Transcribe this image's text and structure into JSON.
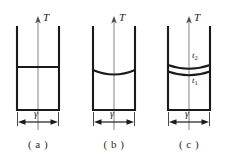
{
  "figure": {
    "width": 227,
    "height": 162,
    "background": "#ffffff",
    "stroke_color": "#1a1a1a",
    "axis_color": "#8a8a8a"
  },
  "labels": {
    "axis_T": "T",
    "gamma": "γ",
    "t_upper": "t",
    "t_upper_sub": "2",
    "t_lower": "t",
    "t_lower_sub": "1"
  },
  "panels": [
    {
      "id": "panel-a",
      "caption": "( a )",
      "axis_label": "T",
      "width_label": "γ",
      "surface_type": "flat",
      "surface_count": 1,
      "surface_labels": []
    },
    {
      "id": "panel-b",
      "caption": "( b )",
      "axis_label": "T",
      "width_label": "γ",
      "surface_type": "concave",
      "surface_count": 1,
      "surface_labels": []
    },
    {
      "id": "panel-c",
      "caption": "( c )",
      "axis_label": "T",
      "width_label": "γ",
      "surface_type": "concave-double",
      "surface_count": 2,
      "surface_labels": [
        "t2",
        "t1"
      ]
    }
  ]
}
